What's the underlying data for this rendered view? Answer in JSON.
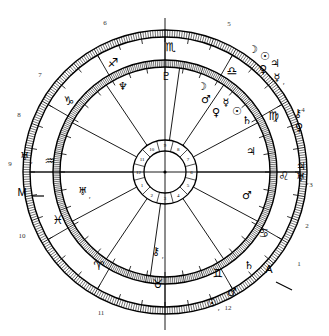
{
  "chart": {
    "type": "astrological-natal-wheel",
    "center_dot": "●",
    "angles": [
      {
        "name": "midheaven-marker",
        "label": "M",
        "x": 22,
        "y": 196
      },
      {
        "name": "ascendant-marker",
        "label": "A",
        "x": 269,
        "y": 273
      }
    ],
    "outer_house_numbers": [
      {
        "label": "1",
        "x": 299,
        "y": 266
      },
      {
        "label": "2",
        "x": 307,
        "y": 228
      },
      {
        "label": "3",
        "x": 311,
        "y": 187
      },
      {
        "label": "4",
        "x": 303,
        "y": 112
      },
      {
        "label": "5",
        "x": 229,
        "y": 26
      },
      {
        "label": "6",
        "x": 105,
        "y": 25
      },
      {
        "label": "7",
        "x": 40,
        "y": 77
      },
      {
        "label": "8",
        "x": 19,
        "y": 117
      },
      {
        "label": "9",
        "x": 10,
        "y": 166
      },
      {
        "label": "10",
        "x": 22,
        "y": 238
      },
      {
        "label": "11",
        "x": 101,
        "y": 315
      },
      {
        "label": "12",
        "x": 228,
        "y": 310
      }
    ],
    "inner_house_numbers": [
      "1",
      "2",
      "3",
      "4",
      "5",
      "6",
      "7",
      "8",
      "9",
      "10",
      "11",
      "12"
    ],
    "zodiac_signs": [
      {
        "name": "scorpio",
        "glyph": "♏",
        "x": 171,
        "y": 51
      },
      {
        "name": "libra",
        "glyph": "♎",
        "x": 232,
        "y": 75
      },
      {
        "name": "virgo",
        "glyph": "♍",
        "x": 274,
        "y": 120
      },
      {
        "name": "leo",
        "glyph": "♌",
        "x": 284,
        "y": 180
      },
      {
        "name": "cancer",
        "glyph": "♋",
        "x": 264,
        "y": 237
      },
      {
        "name": "gemini",
        "glyph": "♊",
        "x": 218,
        "y": 277
      },
      {
        "name": "taurus",
        "glyph": "♉",
        "x": 158,
        "y": 288
      },
      {
        "name": "aries",
        "glyph": "♈",
        "x": 99,
        "y": 270
      },
      {
        "name": "pisces",
        "glyph": "♓",
        "x": 58,
        "y": 224
      },
      {
        "name": "aquarius",
        "glyph": "♒",
        "x": 50,
        "y": 165
      },
      {
        "name": "capricorn",
        "glyph": "♑",
        "x": 69,
        "y": 105
      },
      {
        "name": "sagittarius",
        "glyph": "♐",
        "x": 113,
        "y": 67
      }
    ],
    "inner_ring_planets": [
      {
        "name": "pluto",
        "glyph": "♇",
        "x": 166,
        "y": 80,
        "retrograde": false
      },
      {
        "name": "moon",
        "glyph": "☽",
        "x": 202,
        "y": 90,
        "retrograde": false
      },
      {
        "name": "mars",
        "glyph": "♂",
        "x": 206,
        "y": 103,
        "retrograde": false
      },
      {
        "name": "mercury",
        "glyph": "☿",
        "x": 226,
        "y": 106,
        "retrograde": false
      },
      {
        "name": "venus",
        "glyph": "♀",
        "x": 216,
        "y": 116,
        "retrograde": false
      },
      {
        "name": "sun",
        "glyph": "☉",
        "x": 237,
        "y": 115,
        "retrograde": false
      },
      {
        "name": "saturn",
        "glyph": "♄",
        "x": 247,
        "y": 124,
        "retrograde": false
      },
      {
        "name": "jupiter",
        "glyph": "♃",
        "x": 251,
        "y": 155,
        "retrograde": false
      },
      {
        "name": "mars-2",
        "glyph": "♂",
        "x": 247,
        "y": 199,
        "retrograde": false
      },
      {
        "name": "chiron",
        "glyph": "⚷",
        "x": 156,
        "y": 255,
        "retrograde": true
      },
      {
        "name": "neptune",
        "glyph": "♆",
        "x": 123,
        "y": 90,
        "retrograde": false
      },
      {
        "name": "uranus",
        "glyph": "♅",
        "x": 83,
        "y": 195,
        "retrograde": true
      }
    ],
    "outer_ring_planets": [
      {
        "name": "moon-outer",
        "glyph": "☽",
        "x": 253,
        "y": 53,
        "retrograde": false
      },
      {
        "name": "sun-outer",
        "glyph": "☉",
        "x": 265,
        "y": 60,
        "retrograde": false
      },
      {
        "name": "venus-outer",
        "glyph": "♀",
        "x": 263,
        "y": 73,
        "retrograde": false
      },
      {
        "name": "jupiter-outer",
        "glyph": "♃",
        "x": 275,
        "y": 67,
        "retrograde": false
      },
      {
        "name": "mercury-outer",
        "glyph": "☿",
        "x": 277,
        "y": 81,
        "retrograde": true
      },
      {
        "name": "chiron-outer",
        "glyph": "⚷",
        "x": 298,
        "y": 117,
        "retrograde": false
      },
      {
        "name": "venus-outer-2",
        "glyph": "♀",
        "x": 299,
        "y": 131,
        "retrograde": false
      },
      {
        "name": "jupiter-outer-2",
        "glyph": "♃",
        "x": 301,
        "y": 170,
        "retrograde": false
      },
      {
        "name": "uranus-outer",
        "glyph": "♅",
        "x": 301,
        "y": 181,
        "retrograde": true
      },
      {
        "name": "saturn-outer",
        "glyph": "♄",
        "x": 249,
        "y": 269,
        "retrograde": false
      },
      {
        "name": "mars-outer",
        "glyph": "♂",
        "x": 232,
        "y": 296,
        "retrograde": false
      },
      {
        "name": "sun-outer-2",
        "glyph": "☉",
        "x": 212,
        "y": 307,
        "retrograde": true
      },
      {
        "name": "uranus-outer-2",
        "glyph": "♅",
        "x": 25,
        "y": 160,
        "retrograde": true
      }
    ]
  }
}
